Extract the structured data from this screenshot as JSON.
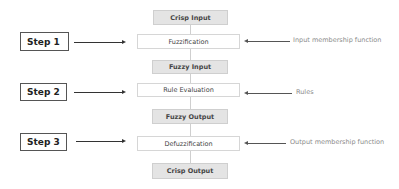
{
  "flow": {
    "crisp_input": "Crisp Input",
    "fuzzification": "Fuzzification",
    "fuzzy_input": "Fuzzy Input",
    "rule_evaluation": "Rule Evaluation",
    "fuzzy_output": "Fuzzy Output",
    "defuzzification": "Defuzzification",
    "crisp_output": "Crisp Output"
  },
  "steps": {
    "step1": "Step 1",
    "step2": "Step 2",
    "step3": "Step 3"
  },
  "annotations": {
    "step1": "Input membership function",
    "step2": "Rules",
    "step3": "Output membership function"
  },
  "colors": {
    "gray_box_fill": "#e4e4e4",
    "box_border": "#cfcfcf",
    "arrow": "#333333",
    "annotation_text": "#8a8a8a"
  }
}
